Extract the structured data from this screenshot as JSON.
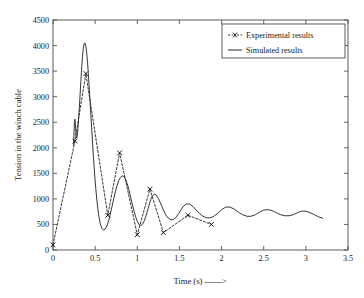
{
  "chart_data": {
    "type": "line",
    "title": "",
    "xlabel": "Time (s) ——>",
    "ylabel": "Tension in the winch cable",
    "xlim": [
      0,
      3.5
    ],
    "ylim": [
      0,
      4500
    ],
    "xticks": [
      "0",
      "0.5",
      "1",
      "1.5",
      "2",
      "2.5",
      "3",
      "3.5"
    ],
    "xtick_values": [
      0,
      0.5,
      1,
      1.5,
      2,
      2.5,
      3,
      3.5
    ],
    "yticks": [
      "0",
      "500",
      "1000",
      "1500",
      "2000",
      "2500",
      "3000",
      "3500",
      "4000",
      "4500"
    ],
    "ytick_values": [
      0,
      500,
      1000,
      1500,
      2000,
      2500,
      3000,
      3500,
      4000,
      4500
    ],
    "grid": false,
    "legend_position": "top-right",
    "series": [
      {
        "name": "Experimental results",
        "style": "dashed-with-x-markers",
        "marker": "x",
        "color": "#2b2b2b",
        "x": [
          0.0,
          0.26,
          0.39,
          0.65,
          0.79,
          1.0,
          1.15,
          1.31,
          1.6,
          1.88
        ],
        "y": [
          100,
          2130,
          3450,
          680,
          1900,
          300,
          1190,
          340,
          680,
          500
        ]
      },
      {
        "name": "Simulated results",
        "style": "solid",
        "marker": "none",
        "color": "#2b2b2b",
        "x": [
          0.245,
          0.25,
          0.255,
          0.26,
          0.265,
          0.27,
          0.275,
          0.28,
          0.285,
          0.29,
          0.295,
          0.3,
          0.31,
          0.32,
          0.33,
          0.34,
          0.35,
          0.36,
          0.37,
          0.38,
          0.39,
          0.4,
          0.41,
          0.42,
          0.44,
          0.46,
          0.48,
          0.5,
          0.52,
          0.54,
          0.56,
          0.58,
          0.6,
          0.62,
          0.64,
          0.66,
          0.68,
          0.7,
          0.72,
          0.74,
          0.76,
          0.78,
          0.8,
          0.82,
          0.84,
          0.86,
          0.88,
          0.9,
          0.92,
          0.94,
          0.96,
          0.98,
          1.0,
          1.02,
          1.04,
          1.06,
          1.08,
          1.1,
          1.12,
          1.14,
          1.16,
          1.18,
          1.2,
          1.22,
          1.25,
          1.28,
          1.31,
          1.34,
          1.37,
          1.4,
          1.43,
          1.46,
          1.49,
          1.52,
          1.55,
          1.58,
          1.62,
          1.66,
          1.7,
          1.74,
          1.78,
          1.82,
          1.86,
          1.9,
          1.95,
          2.0,
          2.05,
          2.1,
          2.15,
          2.2,
          2.25,
          2.3,
          2.35,
          2.4,
          2.45,
          2.5,
          2.55,
          2.6,
          2.65,
          2.7,
          2.75,
          2.8,
          2.85,
          2.9,
          2.95,
          3.0,
          3.05,
          3.1,
          3.15,
          3.2
        ],
        "y": [
          2050,
          2330,
          2520,
          2560,
          2480,
          2340,
          2230,
          2190,
          2210,
          2270,
          2360,
          2470,
          2720,
          3000,
          3290,
          3560,
          3790,
          3950,
          4040,
          4050,
          3990,
          3860,
          3670,
          3430,
          2900,
          2340,
          1810,
          1350,
          980,
          700,
          520,
          420,
          390,
          410,
          470,
          570,
          700,
          850,
          1000,
          1140,
          1260,
          1360,
          1420,
          1450,
          1440,
          1390,
          1300,
          1180,
          1040,
          900,
          770,
          650,
          560,
          500,
          480,
          500,
          560,
          650,
          760,
          880,
          990,
          1060,
          1090,
          1080,
          1010,
          900,
          780,
          680,
          620,
          590,
          600,
          640,
          710,
          790,
          860,
          900,
          900,
          850,
          780,
          710,
          660,
          630,
          630,
          650,
          710,
          790,
          840,
          840,
          800,
          740,
          690,
          660,
          660,
          690,
          740,
          780,
          790,
          770,
          730,
          690,
          670,
          670,
          690,
          730,
          760,
          760,
          730,
          690,
          650,
          620
        ]
      }
    ]
  },
  "legend": {
    "items": [
      {
        "label": "Experimental results",
        "style": "dashed-marker"
      },
      {
        "label": "Simulated results",
        "style": "solid"
      }
    ]
  }
}
